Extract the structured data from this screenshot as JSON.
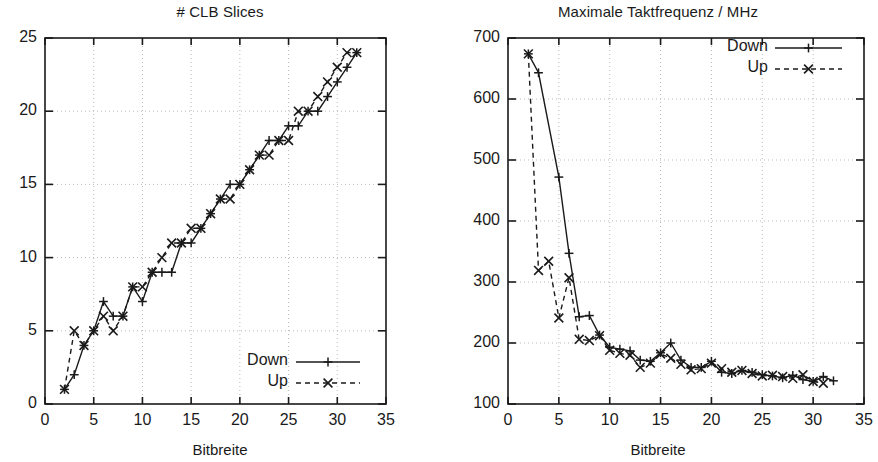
{
  "figure": {
    "width": 878,
    "height": 462,
    "background": "#ffffff",
    "ink_color": "#1a1a1a",
    "grid_color": "#b9b9b9"
  },
  "chart_data": [
    {
      "id": "clb-slices",
      "type": "line",
      "title": "# CLB Slices",
      "xlabel": "Bitbreite",
      "ylabel": "",
      "xlim": [
        0,
        35
      ],
      "ylim": [
        0,
        25
      ],
      "xticks": [
        0,
        5,
        10,
        15,
        20,
        25,
        30,
        35
      ],
      "yticks": [
        0,
        5,
        10,
        15,
        20,
        25
      ],
      "grid": true,
      "legend_position": "bottom-right",
      "series": [
        {
          "name": "Down",
          "marker": "plus",
          "linestyle": "solid",
          "x": [
            2,
            3,
            4,
            5,
            6,
            7,
            8,
            9,
            10,
            11,
            12,
            13,
            14,
            15,
            16,
            17,
            18,
            19,
            20,
            21,
            22,
            23,
            24,
            25,
            26,
            27,
            28,
            29,
            30,
            31,
            32
          ],
          "y": [
            1,
            2,
            4,
            5,
            7,
            6,
            6,
            8,
            7,
            9,
            9,
            9,
            11,
            11,
            12,
            13,
            14,
            15,
            15,
            16,
            17,
            18,
            18,
            19,
            19,
            20,
            20,
            21,
            22,
            23,
            24
          ]
        },
        {
          "name": "Up",
          "marker": "cross",
          "linestyle": "dashed",
          "x": [
            2,
            3,
            4,
            5,
            6,
            7,
            8,
            9,
            10,
            11,
            12,
            13,
            14,
            15,
            16,
            17,
            18,
            19,
            20,
            21,
            22,
            23,
            24,
            25,
            26,
            27,
            28,
            29,
            30,
            31,
            32
          ],
          "y": [
            1,
            5,
            4,
            5,
            6,
            5,
            6,
            8,
            8,
            9,
            10,
            11,
            11,
            12,
            12,
            13,
            14,
            14,
            15,
            16,
            17,
            17,
            18,
            18,
            20,
            20,
            21,
            22,
            23,
            24,
            24
          ]
        }
      ]
    },
    {
      "id": "max-clock-frequency",
      "type": "line",
      "title": "Maximale Taktfrequenz / MHz",
      "xlabel": "Bitbreite",
      "ylabel": "",
      "xlim": [
        0,
        35
      ],
      "ylim": [
        100,
        700
      ],
      "xticks": [
        0,
        5,
        10,
        15,
        20,
        25,
        30,
        35
      ],
      "yticks": [
        100,
        200,
        300,
        400,
        500,
        600,
        700
      ],
      "grid": true,
      "legend_position": "top-right",
      "series": [
        {
          "name": "Down",
          "marker": "plus",
          "linestyle": "solid",
          "x": [
            2,
            3,
            5,
            6,
            7,
            8,
            9,
            10,
            11,
            12,
            13,
            14,
            15,
            16,
            17,
            18,
            19,
            20,
            21,
            22,
            23,
            24,
            25,
            26,
            27,
            28,
            29,
            30,
            31,
            32
          ],
          "y": [
            674,
            643,
            472,
            347,
            243,
            245,
            213,
            193,
            190,
            187,
            172,
            170,
            184,
            200,
            172,
            160,
            160,
            170,
            152,
            150,
            155,
            152,
            148,
            146,
            143,
            147,
            140,
            137,
            145,
            138
          ]
        },
        {
          "name": "Up",
          "marker": "cross",
          "linestyle": "dashed",
          "x": [
            2,
            3,
            4,
            5,
            6,
            7,
            8,
            9,
            10,
            11,
            12,
            13,
            14,
            15,
            16,
            17,
            18,
            19,
            20,
            21,
            22,
            23,
            24,
            25,
            26,
            27,
            28,
            29,
            30,
            31,
            32
          ],
          "y": [
            674,
            319,
            334,
            241,
            307,
            206,
            204,
            212,
            188,
            183,
            180,
            160,
            167,
            182,
            175,
            165,
            156,
            158,
            167,
            158,
            152,
            155,
            150,
            146,
            147,
            145,
            142,
            148,
            137,
            134
          ]
        }
      ]
    }
  ],
  "panels": [
    {
      "id": "left",
      "title": "# CLB Slices",
      "xlabel": "Bitbreite",
      "ytick_labels": [
        "25",
        "20",
        "15",
        "10",
        "5",
        "0"
      ],
      "xtick_labels": [
        "0",
        "5",
        "10",
        "15",
        "20",
        "25",
        "30",
        "35"
      ],
      "legend": [
        {
          "label": "Down",
          "style": "solid-plus"
        },
        {
          "label": "Up",
          "style": "dashed-cross"
        }
      ]
    },
    {
      "id": "right",
      "title": "Maximale Taktfrequenz / MHz",
      "xlabel": "Bitbreite",
      "ytick_labels": [
        "700",
        "600",
        "500",
        "400",
        "300",
        "200",
        "100"
      ],
      "xtick_labels": [
        "0",
        "5",
        "10",
        "15",
        "20",
        "25",
        "30",
        "35"
      ],
      "legend": [
        {
          "label": "Down",
          "style": "solid-plus"
        },
        {
          "label": "Up",
          "style": "dashed-cross"
        }
      ]
    }
  ]
}
